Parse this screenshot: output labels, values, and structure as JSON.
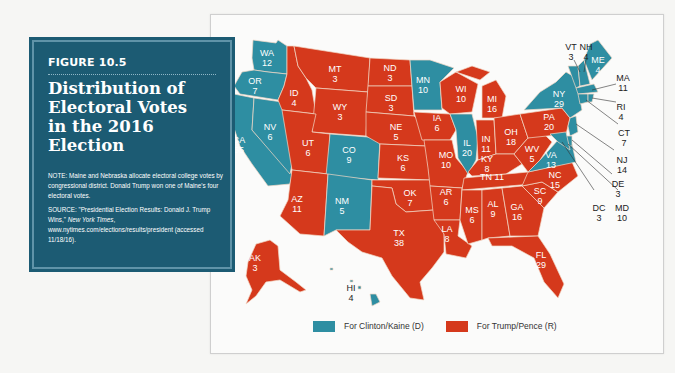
{
  "figure": {
    "label": "FIGURE 10.5",
    "title_lines": [
      "Distribution of",
      "Electoral Votes",
      "in the 2016",
      "Election"
    ],
    "note": "NOTE: Maine and Nebraska allocate electoral college votes by congressional district. Donald Trump won one of Maine's four electoral votes.",
    "source_prefix": "SOURCE: \"Presidential Election Results: Donald J. Trump Wins,\" ",
    "source_publication": "New York Times",
    "source_suffix": ", www.nytimes.com/elections/results/president (accessed 11/18/16)."
  },
  "colors": {
    "democrat": "#2e8ea2",
    "republican": "#d5391c",
    "panel": "#1c5b73"
  },
  "legend": [
    {
      "label": "For Clinton/Kaine (D)",
      "party": "D",
      "color": "#2e8ea2"
    },
    {
      "label": "For Trump/Pence (R)",
      "party": "R",
      "color": "#d5391c"
    }
  ],
  "states": [
    {
      "abbr": "WA",
      "votes": "12",
      "party": "D"
    },
    {
      "abbr": "OR",
      "votes": "7",
      "party": "D"
    },
    {
      "abbr": "CA",
      "votes": "55",
      "party": "D"
    },
    {
      "abbr": "NV",
      "votes": "6",
      "party": "D"
    },
    {
      "abbr": "ID",
      "votes": "4",
      "party": "R"
    },
    {
      "abbr": "MT",
      "votes": "3",
      "party": "R"
    },
    {
      "abbr": "WY",
      "votes": "3",
      "party": "R"
    },
    {
      "abbr": "UT",
      "votes": "6",
      "party": "R"
    },
    {
      "abbr": "CO",
      "votes": "9",
      "party": "D"
    },
    {
      "abbr": "AZ",
      "votes": "11",
      "party": "R"
    },
    {
      "abbr": "NM",
      "votes": "5",
      "party": "D"
    },
    {
      "abbr": "ND",
      "votes": "3",
      "party": "R"
    },
    {
      "abbr": "SD",
      "votes": "3",
      "party": "R"
    },
    {
      "abbr": "NE",
      "votes": "5",
      "party": "R"
    },
    {
      "abbr": "KS",
      "votes": "6",
      "party": "R"
    },
    {
      "abbr": "OK",
      "votes": "7",
      "party": "R"
    },
    {
      "abbr": "TX",
      "votes": "38",
      "party": "R"
    },
    {
      "abbr": "MN",
      "votes": "10",
      "party": "D"
    },
    {
      "abbr": "IA",
      "votes": "6",
      "party": "R"
    },
    {
      "abbr": "MO",
      "votes": "10",
      "party": "R"
    },
    {
      "abbr": "AR",
      "votes": "6",
      "party": "R"
    },
    {
      "abbr": "LA",
      "votes": "8",
      "party": "R"
    },
    {
      "abbr": "WI",
      "votes": "10",
      "party": "R"
    },
    {
      "abbr": "IL",
      "votes": "20",
      "party": "D"
    },
    {
      "abbr": "MI",
      "votes": "16",
      "party": "R"
    },
    {
      "abbr": "IN",
      "votes": "11",
      "party": "R"
    },
    {
      "abbr": "OH",
      "votes": "18",
      "party": "R"
    },
    {
      "abbr": "KY",
      "votes": "8",
      "party": "R"
    },
    {
      "abbr": "TN",
      "votes": "11",
      "party": "R"
    },
    {
      "abbr": "MS",
      "votes": "6",
      "party": "R"
    },
    {
      "abbr": "AL",
      "votes": "9",
      "party": "R"
    },
    {
      "abbr": "GA",
      "votes": "16",
      "party": "R"
    },
    {
      "abbr": "FL",
      "votes": "29",
      "party": "R"
    },
    {
      "abbr": "SC",
      "votes": "9",
      "party": "R"
    },
    {
      "abbr": "NC",
      "votes": "15",
      "party": "R"
    },
    {
      "abbr": "VA",
      "votes": "13",
      "party": "D"
    },
    {
      "abbr": "WV",
      "votes": "5",
      "party": "R"
    },
    {
      "abbr": "PA",
      "votes": "20",
      "party": "R"
    },
    {
      "abbr": "NY",
      "votes": "29",
      "party": "D"
    },
    {
      "abbr": "VT",
      "votes": "3",
      "party": "D"
    },
    {
      "abbr": "NH",
      "votes": "4",
      "party": "D"
    },
    {
      "abbr": "ME",
      "votes": "4",
      "party": "D"
    },
    {
      "abbr": "MA",
      "votes": "11",
      "party": "D"
    },
    {
      "abbr": "RI",
      "votes": "4",
      "party": "D"
    },
    {
      "abbr": "CT",
      "votes": "7",
      "party": "D"
    },
    {
      "abbr": "NJ",
      "votes": "14",
      "party": "D"
    },
    {
      "abbr": "DE",
      "votes": "3",
      "party": "D"
    },
    {
      "abbr": "MD",
      "votes": "10",
      "party": "D"
    },
    {
      "abbr": "DC",
      "votes": "3",
      "party": "D"
    },
    {
      "abbr": "AK",
      "votes": "3",
      "party": "R"
    },
    {
      "abbr": "HI",
      "votes": "4",
      "party": "D"
    }
  ]
}
